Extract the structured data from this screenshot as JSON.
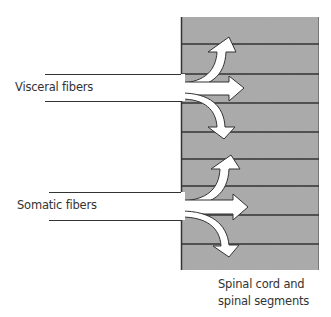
{
  "labels": {
    "visceral": "Visceral fibers",
    "somatic": "Somatic fibers",
    "caption_line1": "Spinal cord and",
    "caption_line2": "spinal segments"
  },
  "colors": {
    "spinal_cord_fill": "#a9a9a9",
    "segment_line": "#333333",
    "arrow_fill": "#ffffff",
    "arrow_stroke": "#333333",
    "text": "#333333"
  },
  "spinal_cord": {
    "x": 181,
    "y": 17,
    "width": 138,
    "height": 253,
    "segment_boundaries_y": [
      44,
      74,
      103,
      132,
      159,
      186,
      215,
      244
    ]
  },
  "fiber_bundles": [
    {
      "name": "visceral",
      "label_key": "visceral",
      "incoming_lines_y": [
        74,
        101
      ],
      "branches": [
        "up",
        "straight",
        "down"
      ]
    },
    {
      "name": "somatic",
      "label_key": "somatic",
      "incoming_lines_y": [
        192,
        220
      ],
      "branches": [
        "up",
        "straight",
        "down"
      ]
    }
  ]
}
